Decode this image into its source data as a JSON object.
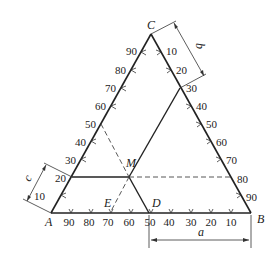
{
  "vertices": {
    "A": {
      "label": "A",
      "x": 51,
      "y": 213
    },
    "B": {
      "label": "B",
      "x": 251,
      "y": 213
    },
    "C": {
      "label": "C",
      "x": 151,
      "y": 34
    }
  },
  "points": {
    "M": {
      "label": "M"
    },
    "D": {
      "label": "D"
    },
    "E": {
      "label": "E"
    }
  },
  "axes": {
    "left_AC": {
      "ticks": [
        "10",
        "20",
        "30",
        "40",
        "50",
        "60",
        "70",
        "80",
        "90"
      ]
    },
    "right_CB": {
      "ticks": [
        "10",
        "20",
        "30",
        "40",
        "50",
        "60",
        "70",
        "80",
        "90"
      ]
    },
    "bottom_AB": {
      "ticks": [
        "90",
        "80",
        "70",
        "60",
        "50",
        "40",
        "30",
        "20",
        "10"
      ]
    }
  },
  "dimensions": {
    "a": {
      "label": "a"
    },
    "b": {
      "label": "b"
    },
    "c": {
      "label": "c"
    }
  },
  "composition_M": {
    "a": 50,
    "b": 30,
    "c": 20
  }
}
